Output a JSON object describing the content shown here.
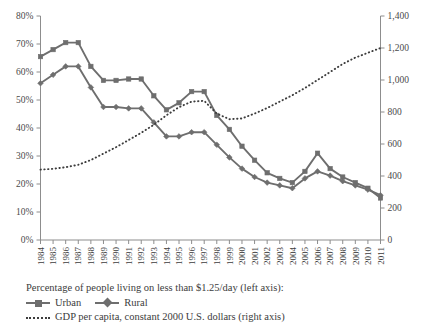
{
  "chart_data": {
    "type": "line",
    "title": "",
    "subtitle": "",
    "xlabel": "",
    "ylabel": "",
    "y2label": "",
    "grid": false,
    "legend_position": "bottom-left",
    "x": [
      1984,
      1985,
      1986,
      1987,
      1988,
      1989,
      1990,
      1991,
      1992,
      1993,
      1994,
      1995,
      1996,
      1997,
      1998,
      1999,
      2000,
      2001,
      2002,
      2003,
      2004,
      2005,
      2006,
      2007,
      2008,
      2009,
      2010,
      2011
    ],
    "xtick_labels": [
      "1984",
      "1985",
      "1986",
      "1987",
      "1988",
      "1989",
      "1990",
      "1991",
      "1992",
      "1993",
      "1994",
      "1995",
      "1996",
      "1997",
      "1998",
      "1999",
      "2000",
      "2001",
      "2002",
      "2003",
      "2004",
      "2005",
      "2006",
      "2007",
      "2008",
      "2009",
      "2010",
      "2011"
    ],
    "ylim": [
      0,
      80
    ],
    "ytick_labels": [
      "0%",
      "10%",
      "20%",
      "30%",
      "40%",
      "50%",
      "60%",
      "70%",
      "80%"
    ],
    "ytick_values": [
      0,
      10,
      20,
      30,
      40,
      50,
      60,
      70,
      80
    ],
    "y2lim": [
      0,
      1400
    ],
    "y2tick_labels": [
      "0",
      "200",
      "400",
      "600",
      "800",
      "1,000",
      "1,200",
      "1,400"
    ],
    "y2tick_values": [
      0,
      200,
      400,
      600,
      800,
      1000,
      1200,
      1400
    ],
    "series": [
      {
        "name": "Urban",
        "axis": "left",
        "style": "solid",
        "marker": "square",
        "color": "#6e6e6e",
        "values": [
          65.5,
          68.0,
          70.5,
          70.5,
          62.0,
          57.0,
          57.0,
          57.5,
          57.5,
          51.5,
          46.5,
          49.0,
          53.0,
          53.0,
          44.5,
          39.5,
          33.5,
          28.5,
          24.0,
          22.0,
          20.5,
          24.5,
          31.0,
          25.5,
          22.5,
          20.5,
          18.5,
          15.0
        ]
      },
      {
        "name": "Rural",
        "axis": "left",
        "style": "solid",
        "marker": "diamond",
        "color": "#6e6e6e",
        "values": [
          56.0,
          59.0,
          62.0,
          62.0,
          54.5,
          47.5,
          47.5,
          47.0,
          47.0,
          42.0,
          37.0,
          37.0,
          38.5,
          38.5,
          34.0,
          29.5,
          25.5,
          22.5,
          20.5,
          19.5,
          18.5,
          22.0,
          24.5,
          23.0,
          21.0,
          19.5,
          18.0,
          16.0
        ]
      },
      {
        "name": "GDP per capita, constant 2000 U.S. dollars",
        "axis": "right",
        "style": "dotted",
        "marker": "none",
        "color": "#3d3d3d",
        "values": [
          440,
          445,
          455,
          470,
          500,
          540,
          580,
          625,
          670,
          720,
          780,
          830,
          865,
          870,
          790,
          755,
          760,
          790,
          825,
          865,
          905,
          950,
          1000,
          1050,
          1100,
          1140,
          1170,
          1200
        ]
      }
    ]
  },
  "legend": {
    "caption": "Percentage of people living on less than $1.25/day (left axis):",
    "entries": [
      {
        "label": "Urban",
        "marker": "square",
        "style": "solid"
      },
      {
        "label": "Rural",
        "marker": "diamond",
        "style": "solid"
      }
    ],
    "dotted_entry": {
      "label": "GDP per capita, constant 2000 U.S. dollars (right axis)",
      "style": "dotted"
    }
  },
  "colors": {
    "series_gray": "#6e6e6e",
    "dotted_dark": "#3d3d3d",
    "axis": "#8d8d8d",
    "text": "#3c3c3c",
    "background": "#ffffff"
  }
}
